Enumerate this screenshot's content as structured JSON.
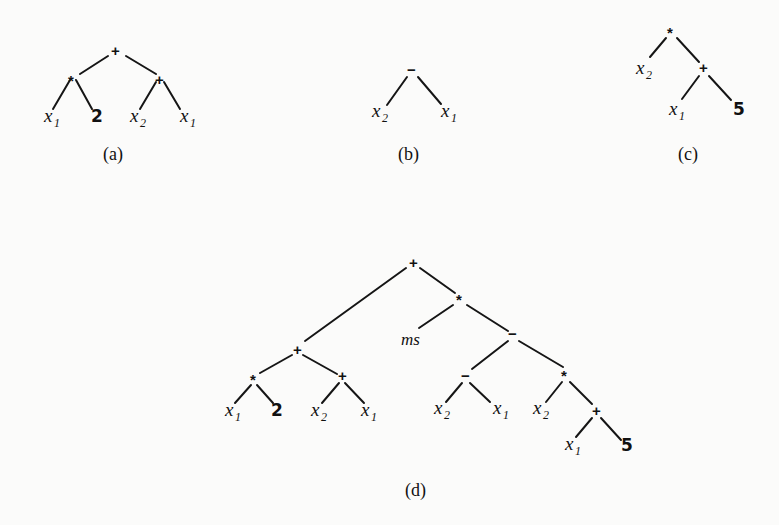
{
  "figure": {
    "panels": [
      {
        "id": "a",
        "caption": "(a)",
        "expression": "(x1 * 2) + (x2 + x1)",
        "nodes": {
          "root": "+",
          "left": "*",
          "left_left": "x1",
          "left_right": "2",
          "right": "+",
          "right_left": "x2",
          "right_right": "x1"
        }
      },
      {
        "id": "b",
        "caption": "(b)",
        "expression": "x2 − x1",
        "nodes": {
          "root": "−",
          "left": "x2",
          "right": "x1"
        }
      },
      {
        "id": "c",
        "caption": "(c)",
        "expression": "x2 * (x1 + 5)",
        "nodes": {
          "root": "*",
          "left": "x2",
          "right": "+",
          "right_left": "x1",
          "right_right": "5"
        }
      },
      {
        "id": "d",
        "caption": "(d)",
        "expression": "((x1 * 2) + (x2 + x1)) + (ms * ((x2 − x1) − (x2 * (x1 + 5))))",
        "nodes": {
          "root": "+",
          "l": "+",
          "l_l": "*",
          "l_l_l": "x1",
          "l_l_r": "2",
          "l_r": "+",
          "l_r_l": "x2",
          "l_r_r": "x1",
          "r": "*",
          "r_l": "ms",
          "r_r": "−",
          "r_r_l": "−",
          "r_r_l_l": "x2",
          "r_r_l_r": "x1",
          "r_r_r": "*",
          "r_r_r_l": "x2",
          "r_r_r_r": "+",
          "r_r_r_r_l": "x1",
          "r_r_r_r_r": "5"
        }
      }
    ],
    "symbols": {
      "plus": "+",
      "times": "*",
      "minus": "−",
      "x": "x",
      "one": "1",
      "two": "2",
      "five": "5",
      "ms": "ms"
    }
  }
}
